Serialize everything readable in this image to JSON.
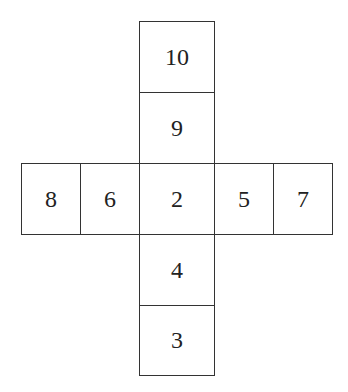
{
  "diagram": {
    "type": "cube-net",
    "column_top": [
      "10",
      "9"
    ],
    "row_middle": [
      "8",
      "6",
      "2",
      "5",
      "7"
    ],
    "column_bottom": [
      "4",
      "3"
    ]
  }
}
